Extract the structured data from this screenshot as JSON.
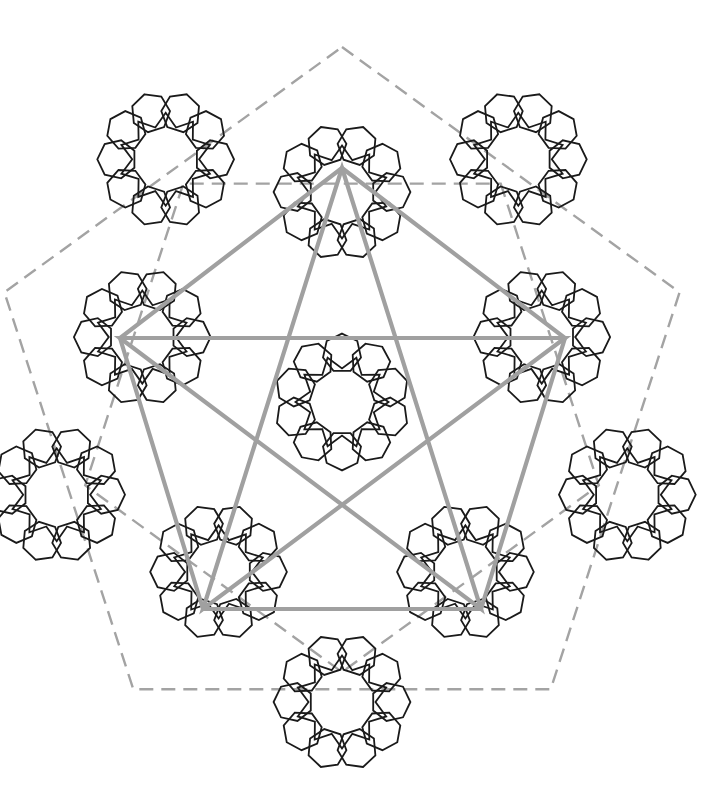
{
  "diagram": {
    "center": [
      342,
      402
    ],
    "colors": {
      "background": "#ffffff",
      "pattern": "#1a1a1a",
      "construction": "#a0a0a0",
      "dashed": "#a3a3a3"
    },
    "construction_pentagon": {
      "vertices": [
        [
          342,
          168
        ],
        [
          565,
          338
        ],
        [
          481,
          609
        ],
        [
          203,
          609
        ],
        [
          120,
          338
        ]
      ]
    },
    "dashed_pentagons": [
      {
        "radius": 270,
        "rotation": 36
      },
      {
        "radius": 355,
        "rotation": 0
      }
    ],
    "star_ring_inner": {
      "radius": 105,
      "points": 10,
      "rotation": 18
    },
    "rosettes": [
      {
        "radius": 0,
        "angle": 0,
        "size": 62
      },
      {
        "radius": 210,
        "angle": -90,
        "size": 62
      },
      {
        "radius": 210,
        "angle": -18,
        "size": 62
      },
      {
        "radius": 210,
        "angle": 54,
        "size": 62
      },
      {
        "radius": 210,
        "angle": 126,
        "size": 62
      },
      {
        "radius": 210,
        "angle": 198,
        "size": 62
      },
      {
        "radius": 300,
        "angle": -54,
        "size": 62
      },
      {
        "radius": 300,
        "angle": 18,
        "size": 62
      },
      {
        "radius": 300,
        "angle": 90,
        "size": 62
      },
      {
        "radius": 300,
        "angle": 162,
        "size": 62
      },
      {
        "radius": 300,
        "angle": 234,
        "size": 62
      }
    ]
  }
}
